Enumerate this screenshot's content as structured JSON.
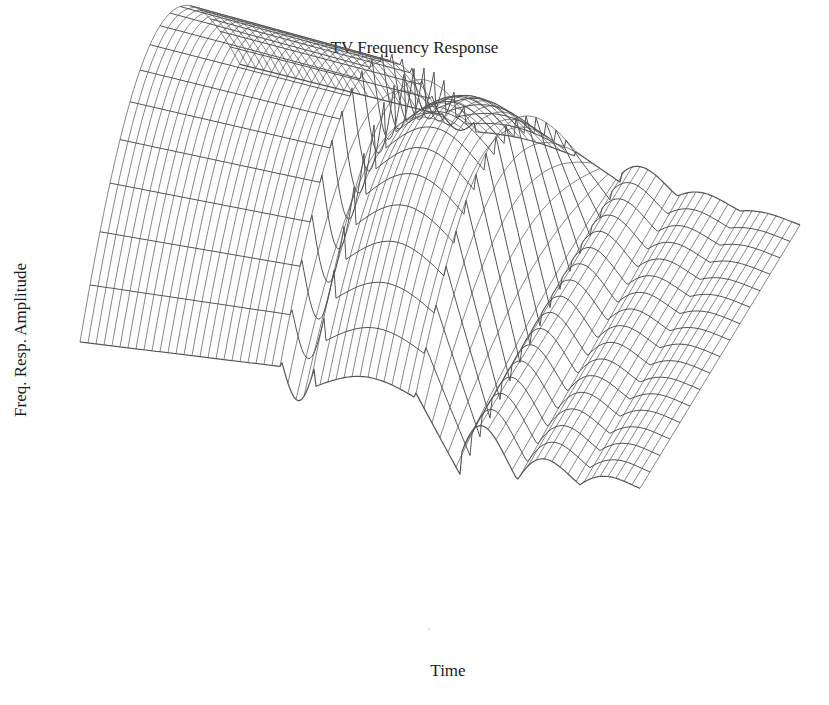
{
  "chart_data": {
    "type": "surface",
    "title": "TV Frequency Response",
    "xlabel": "Time",
    "ylabel": "Freq. Resp. Amplitude",
    "zlabel": "",
    "ticks": "none",
    "grid": false,
    "legend": "none",
    "style": "wireframe mesh, grayscale",
    "colors": {
      "line": "#555555",
      "background": "#ffffff",
      "text": "#1a1a1a"
    },
    "features": [
      {
        "name": "initial plateau",
        "time_range": [
          0.0,
          0.35
        ],
        "amplitude": "high, curved across frequency"
      },
      {
        "name": "ridge dip",
        "time_range": [
          0.35,
          0.45
        ],
        "amplitude": "local peak then notch"
      },
      {
        "name": "second hump",
        "time_range": [
          0.45,
          0.6
        ],
        "amplitude": "high"
      },
      {
        "name": "drop to low plane",
        "time_range": [
          0.6,
          0.75
        ],
        "amplitude": "low"
      },
      {
        "name": "ripples",
        "time_range": [
          0.75,
          1.0
        ],
        "amplitude": "decaying oscillation"
      }
    ]
  }
}
